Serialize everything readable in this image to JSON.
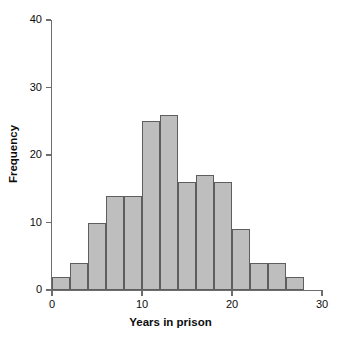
{
  "chart_data": {
    "type": "bar",
    "subtype": "histogram",
    "title": "",
    "xlabel": "Years in prison",
    "ylabel": "Frequency",
    "xlim": [
      0,
      30
    ],
    "ylim": [
      0,
      40
    ],
    "xticks": [
      0,
      10,
      20,
      30
    ],
    "xtick_labels": [
      "0",
      "10",
      "20",
      "30"
    ],
    "yticks": [
      0,
      10,
      20,
      30,
      40
    ],
    "ytick_labels": [
      "0",
      "10",
      "20",
      "30",
      "40"
    ],
    "grid": false,
    "legend": false,
    "bin_width": 2,
    "bin_edges": [
      0,
      2,
      4,
      6,
      8,
      10,
      12,
      14,
      16,
      18,
      20,
      22,
      24,
      26,
      28
    ],
    "categories": [
      "0-2",
      "2-4",
      "4-6",
      "6-8",
      "8-10",
      "10-12",
      "12-14",
      "14-16",
      "16-18",
      "18-20",
      "20-22",
      "22-24",
      "24-26",
      "26-28"
    ],
    "values": [
      2,
      4,
      10,
      14,
      14,
      25,
      26,
      16,
      17,
      16,
      9,
      4,
      4,
      2
    ],
    "bars": [
      {
        "x0": 0,
        "x1": 2,
        "value": 2
      },
      {
        "x0": 2,
        "x1": 4,
        "value": 4
      },
      {
        "x0": 4,
        "x1": 6,
        "value": 10
      },
      {
        "x0": 6,
        "x1": 8,
        "value": 14
      },
      {
        "x0": 8,
        "x1": 10,
        "value": 14
      },
      {
        "x0": 10,
        "x1": 12,
        "value": 25
      },
      {
        "x0": 12,
        "x1": 14,
        "value": 26
      },
      {
        "x0": 14,
        "x1": 16,
        "value": 16
      },
      {
        "x0": 16,
        "x1": 18,
        "value": 17
      },
      {
        "x0": 18,
        "x1": 20,
        "value": 16
      },
      {
        "x0": 20,
        "x1": 22,
        "value": 9
      },
      {
        "x0": 22,
        "x1": 24,
        "value": 4
      },
      {
        "x0": 24,
        "x1": 26,
        "value": 4
      },
      {
        "x0": 26,
        "x1": 28,
        "value": 2
      }
    ],
    "colors": {
      "bar_fill": "#bebebe",
      "bar_edge": "#5e5e5e",
      "axis": "#6d6d6d",
      "text": "#0d0d0d",
      "background": "#ffffff"
    }
  }
}
